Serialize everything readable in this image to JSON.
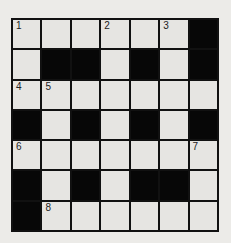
{
  "puzzle": {
    "type": "crossword",
    "size": 7,
    "grid": [
      "WWWWWWB",
      "WBBWBWB",
      "WWWWWWW",
      "BWBWBWB",
      "WWWWWWW",
      "BWBWBBW",
      "BWWWWWW"
    ],
    "numbers": [
      {
        "row": 0,
        "col": 0,
        "n": "1"
      },
      {
        "row": 0,
        "col": 3,
        "n": "2"
      },
      {
        "row": 0,
        "col": 5,
        "n": "3"
      },
      {
        "row": 2,
        "col": 0,
        "n": "4"
      },
      {
        "row": 2,
        "col": 1,
        "n": "5"
      },
      {
        "row": 4,
        "col": 0,
        "n": "6"
      },
      {
        "row": 4,
        "col": 6,
        "n": "7"
      },
      {
        "row": 6,
        "col": 1,
        "n": "8"
      }
    ],
    "colors": {
      "white_cell": "#e6e5e2",
      "black_cell": "#070707",
      "background": "#ecebe8"
    }
  }
}
